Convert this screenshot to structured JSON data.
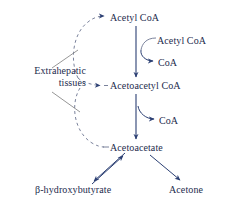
{
  "diagram": {
    "colors": {
      "text": "#1d2b4d",
      "arrow_solid": "#2b3f73",
      "arrow_dashed": "#6b7490",
      "line_gray": "#8a8a8a",
      "background": "#ffffff"
    },
    "nodes": {
      "acetyl_coa_top": "Acetyl CoA",
      "acetyl_coa_side": "Acetyl CoA",
      "coa_upper": "CoA",
      "acetoacetyl_coa": "Acetoacetyl CoA",
      "coa_lower": "CoA",
      "acetoacetate": "Acetoacetate",
      "extrahepatic_line1": "Extrahepatic",
      "extrahepatic_line2": "tissues",
      "beta_hydroxybutyrate": "β-hydroxybutyrate",
      "acetone": "Acetone"
    },
    "edges": [
      {
        "name": "acetyl-coa-to-acetoacetyl-coa",
        "from": "Acetyl CoA",
        "to": "Acetoacetyl CoA",
        "style": "solid",
        "direction": "down"
      },
      {
        "name": "acetyl-coa-side-input",
        "from": "Acetyl CoA",
        "to": "Acetoacetyl CoA",
        "style": "solid-curve",
        "direction": "in"
      },
      {
        "name": "coa-upper-release",
        "from": "Acetoacetyl CoA",
        "to": "CoA",
        "style": "solid-curve",
        "direction": "out"
      },
      {
        "name": "acetoacetyl-coa-to-acetoacetate",
        "from": "Acetoacetyl CoA",
        "to": "Acetoacetate",
        "style": "solid",
        "direction": "down"
      },
      {
        "name": "coa-lower-release",
        "from": "Acetoacetate",
        "to": "CoA",
        "style": "solid-curve",
        "direction": "out"
      },
      {
        "name": "acetoacetate-to-beta-hydroxybutyrate",
        "from": "Acetoacetate",
        "to": "β-hydroxybutyrate",
        "style": "solid",
        "direction": "reversible"
      },
      {
        "name": "acetoacetate-to-acetone",
        "from": "Acetoacetate",
        "to": "Acetone",
        "style": "solid",
        "direction": "down-right"
      },
      {
        "name": "extrahepatic-to-acetyl-coa",
        "from": "Extrahepatic tissues",
        "to": "Acetyl CoA",
        "style": "dashed-arc",
        "direction": "up-right"
      },
      {
        "name": "extrahepatic-to-acetoacetyl-coa",
        "from": "Extrahepatic tissues",
        "to": "Acetoacetyl CoA",
        "style": "dashed-arc",
        "direction": "right"
      },
      {
        "name": "extrahepatic-to-acetoacetate",
        "from": "Extrahepatic tissues",
        "to": "Acetoacetate",
        "style": "dashed-arc",
        "direction": "down-right"
      }
    ]
  }
}
